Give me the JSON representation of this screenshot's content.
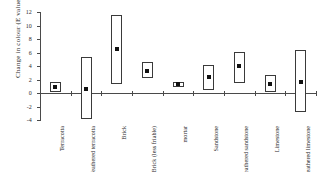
{
  "chart_data": {
    "type": "bar",
    "title": "",
    "xlabel": "",
    "ylabel": "Change in colour (E values)",
    "ylim": [
      -4,
      12
    ],
    "yticks": [
      -4,
      -2,
      0,
      2,
      4,
      6,
      8,
      10,
      12
    ],
    "ytick_labels": [
      "-4",
      "-2",
      "0",
      "2",
      "4",
      "6",
      "8",
      "10",
      "12"
    ],
    "grid": false,
    "legend": "none",
    "categories": [
      "Terracotta",
      "Weathered terracotta",
      "Brick",
      "Brick (less friable)",
      "mortar",
      "Sandstone",
      "Weathered sandstone",
      "Limestone",
      "Weathered limestone"
    ],
    "series": [
      {
        "name": "range_low",
        "values": [
          0.2,
          -3.8,
          1.4,
          2.2,
          0.9,
          0.5,
          1.5,
          0.1,
          -2.8
        ]
      },
      {
        "name": "range_high",
        "values": [
          1.7,
          5.3,
          11.6,
          4.6,
          1.7,
          4.1,
          6.1,
          2.7,
          6.3
        ]
      },
      {
        "name": "mean",
        "values": [
          0.9,
          0.6,
          6.5,
          3.3,
          1.3,
          2.3,
          4.0,
          1.4,
          1.7
        ]
      }
    ]
  }
}
